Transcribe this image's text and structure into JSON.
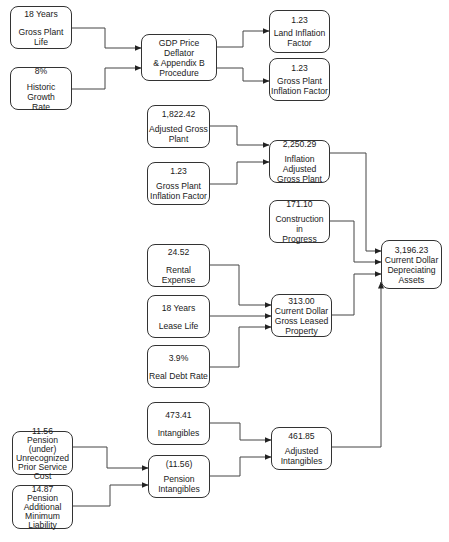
{
  "diagram": {
    "nodes": {
      "gross_plant_life": {
        "value": "18 Years",
        "label": "Gross Plant Life"
      },
      "historic_growth_rate": {
        "value": "8%",
        "label": "Historic Growth\nRate"
      },
      "gdp_procedure": {
        "value": "",
        "label": "GDP Price Deflator\n& Appendix B\nProcedure"
      },
      "land_inflation_factor": {
        "value": "1.23",
        "label": "Land Inflation\nFactor"
      },
      "gross_plant_inflation_factor_top": {
        "value": "1.23",
        "label": "Gross Plant\nInflation Factor"
      },
      "adjusted_gross_plant": {
        "value": "1,822.42",
        "label": "Adjusted Gross\nPlant"
      },
      "inflation_adjusted_gross_plant": {
        "value": "2,250.29",
        "label": "Inflation Adjusted\nGross Plant"
      },
      "gross_plant_inflation_factor_mid": {
        "value": "1.23",
        "label": "Gross Plant\nInflation Factor"
      },
      "construction_in_progress": {
        "value": "171.10",
        "label": "Construction in\nProgress"
      },
      "current_dollar_depreciating_assets": {
        "value": "3,196.23",
        "label": "Current Dollar\nDepreciating\nAssets"
      },
      "rental_expense": {
        "value": "24.52",
        "label": "Rental Expense"
      },
      "lease_life": {
        "value": "18 Years",
        "label": "Lease Life"
      },
      "current_dollar_gross_leased_property": {
        "value": "313.00",
        "label": "Current Dollar\nGross Leased\nProperty"
      },
      "real_debt_rate": {
        "value": "3.9%",
        "label": "Real Debt Rate"
      },
      "intangibles": {
        "value": "473.41",
        "label": "Intangibles"
      },
      "pension_unrecognized_prior_service_cost": {
        "value": "11.56",
        "label": "Pension (under)\nUnrecognized\nPrior Service\nCost"
      },
      "pension_intangibles": {
        "value": "(11.56)",
        "label": "Pension\nIntangibles"
      },
      "adjusted_intangibles": {
        "value": "461.85",
        "label": "Adjusted\nIntangibles"
      },
      "pension_additional_minimum_liability": {
        "value": "14.87",
        "label": "Pension\nAdditional\nMinimum\nLiability"
      }
    },
    "edges": [
      [
        "gross_plant_life",
        "gdp_procedure"
      ],
      [
        "historic_growth_rate",
        "gdp_procedure"
      ],
      [
        "gdp_procedure",
        "land_inflation_factor"
      ],
      [
        "gdp_procedure",
        "gross_plant_inflation_factor_top"
      ],
      [
        "adjusted_gross_plant",
        "inflation_adjusted_gross_plant"
      ],
      [
        "gross_plant_inflation_factor_mid",
        "inflation_adjusted_gross_plant"
      ],
      [
        "inflation_adjusted_gross_plant",
        "current_dollar_depreciating_assets"
      ],
      [
        "construction_in_progress",
        "current_dollar_depreciating_assets"
      ],
      [
        "current_dollar_gross_leased_property",
        "current_dollar_depreciating_assets"
      ],
      [
        "adjusted_intangibles",
        "current_dollar_depreciating_assets"
      ],
      [
        "rental_expense",
        "current_dollar_gross_leased_property"
      ],
      [
        "lease_life",
        "current_dollar_gross_leased_property"
      ],
      [
        "real_debt_rate",
        "current_dollar_gross_leased_property"
      ],
      [
        "intangibles",
        "adjusted_intangibles"
      ],
      [
        "pension_intangibles",
        "adjusted_intangibles"
      ],
      [
        "pension_unrecognized_prior_service_cost",
        "pension_intangibles"
      ],
      [
        "pension_additional_minimum_liability",
        "pension_intangibles"
      ]
    ]
  }
}
